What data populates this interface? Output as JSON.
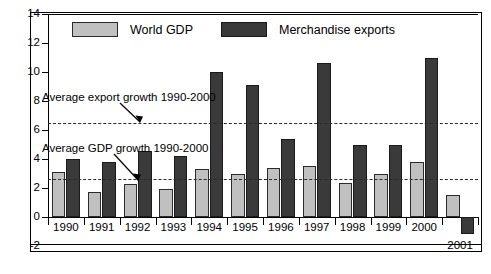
{
  "chart_data": {
    "type": "bar",
    "title": "",
    "xlabel": "",
    "ylabel": "",
    "ylim": [
      -2,
      14
    ],
    "yticks": [
      -2,
      0,
      2,
      4,
      6,
      8,
      10,
      12,
      14
    ],
    "grid": false,
    "legend_position": "top-left",
    "categories": [
      "1990",
      "1991",
      "1992",
      "1993",
      "1994",
      "1995",
      "1996",
      "1997",
      "1998",
      "1999",
      "2000",
      "2001"
    ],
    "series": [
      {
        "name": "World GDP",
        "color": "#c0c0c0",
        "values": [
          3.1,
          1.75,
          2.25,
          1.9,
          3.3,
          3.0,
          3.35,
          3.55,
          2.35,
          2.95,
          3.8,
          1.5
        ]
      },
      {
        "name": "Merchandise exports",
        "color": "#3a3a3a",
        "values": [
          4.0,
          3.8,
          4.55,
          4.2,
          10.0,
          9.1,
          5.4,
          10.6,
          4.95,
          4.95,
          11.0,
          -1.2
        ]
      }
    ],
    "reference_lines": [
      {
        "label": "Average export growth 1990-2000",
        "value": 6.5
      },
      {
        "label": "Average GDP growth 1990-2000",
        "value": 2.6
      }
    ],
    "annotations": [
      {
        "text": "Average export growth 1990-2000"
      },
      {
        "text": "Average GDP growth 1990-2000"
      }
    ]
  },
  "legend": {
    "items": [
      {
        "label": "World GDP"
      },
      {
        "label": "Merchandise exports"
      }
    ]
  },
  "axis": {
    "y_labels": [
      "14",
      "12",
      "10",
      "8",
      "6",
      "4",
      "2",
      "0",
      "-2"
    ],
    "x_labels": [
      "1990",
      "1991",
      "1992",
      "1993",
      "1994",
      "1995",
      "1996",
      "1997",
      "1998",
      "1999",
      "2000",
      "2001"
    ]
  }
}
